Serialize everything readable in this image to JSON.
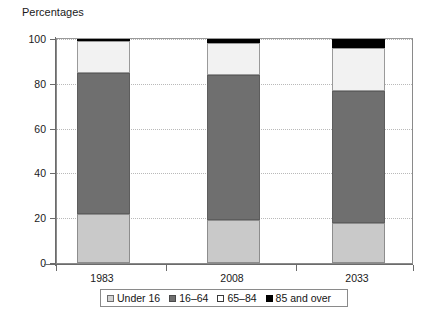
{
  "chart_data": {
    "type": "bar",
    "subtype": "stacked-100-percent",
    "title": "Percentages",
    "xlabel": "",
    "ylabel": "Percentages",
    "ylim": [
      0,
      100
    ],
    "yticks": [
      0,
      20,
      40,
      60,
      80,
      100
    ],
    "ytick_labels": [
      "0",
      "20",
      "40",
      "60",
      "80",
      "100"
    ],
    "grid": true,
    "grid_axis": "y",
    "grid_style": "dotted",
    "legend_position": "bottom",
    "categories": [
      "1983",
      "2008",
      "2033"
    ],
    "series": [
      {
        "name": "Under 16",
        "color": "#c9c9c9",
        "values": [
          22,
          19,
          18
        ]
      },
      {
        "name": "16–64",
        "color": "#6f6f6f",
        "values": [
          63,
          65,
          59
        ]
      },
      {
        "name": "65–84",
        "color": "#f2f2f2",
        "values": [
          14,
          14,
          19
        ]
      },
      {
        "name": "85 and over",
        "color": "#000000",
        "values": [
          1,
          2,
          4
        ]
      }
    ]
  },
  "axis": {
    "title": "Percentages",
    "y_labels": [
      "100",
      "80",
      "60",
      "40",
      "20",
      "0"
    ],
    "x_labels": [
      "1983",
      "2008",
      "2033"
    ]
  },
  "legend": {
    "items": [
      {
        "label": "Under 16",
        "swatch": "swatch-light-gray"
      },
      {
        "label": "16–64",
        "swatch": "swatch-dark-gray"
      },
      {
        "label": "65–84",
        "swatch": "swatch-white"
      },
      {
        "label": "85 and over",
        "swatch": "swatch-black"
      }
    ]
  }
}
